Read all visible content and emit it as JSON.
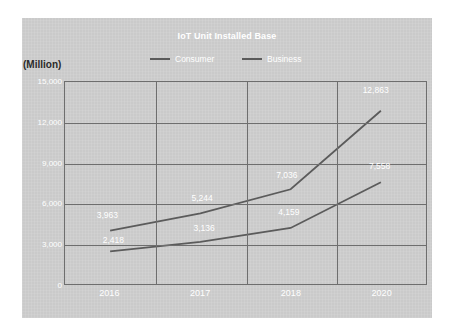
{
  "chart_data": {
    "type": "line",
    "title": "IoT Unit Installed Base",
    "xlabel": "",
    "ylabel": "(Million)",
    "categories": [
      "2016",
      "2017",
      "2018",
      "2020"
    ],
    "series": [
      {
        "name": "Consumer",
        "values": [
          3963,
          5244,
          7036,
          12863
        ],
        "labels": [
          "3,963",
          "5,244",
          "7,036",
          "12,863"
        ]
      },
      {
        "name": "Business",
        "values": [
          2418,
          3136,
          4159,
          7558
        ],
        "labels": [
          "2,418",
          "3,136",
          "4,159",
          "7,558"
        ]
      }
    ],
    "ylim": [
      0,
      15000
    ],
    "yticks": [
      15000,
      12000,
      9000,
      6000,
      3000,
      0
    ],
    "ytick_labels": [
      "15,000",
      "12,000",
      "9,000",
      "6,000",
      "3,000",
      "0"
    ],
    "grid": true,
    "legend_position": "top",
    "colors": {
      "panel_background": "#cecece",
      "grid": "#6e6e6e",
      "consumer_line": "#5b5b5b",
      "business_line": "#5b5b5b",
      "title_text": "#ffffff",
      "tick_text": "#ffffff",
      "axis_unit_text": "#2b2b2b"
    }
  },
  "legend": {
    "consumer_label": "Consumer",
    "business_label": "Business"
  }
}
